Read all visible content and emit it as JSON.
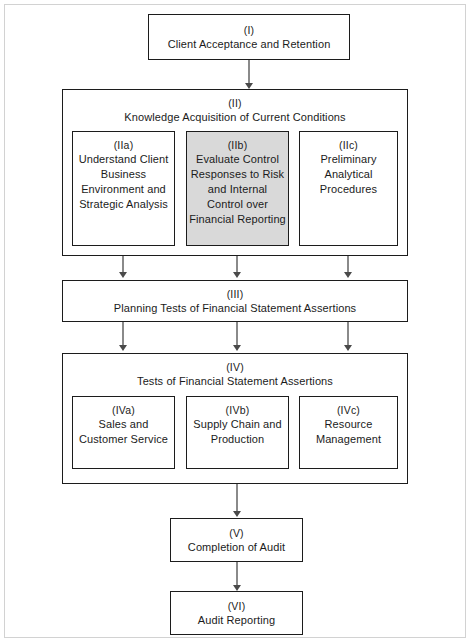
{
  "diagram": {
    "colors": {
      "box_border": "#1c1c1c",
      "shaded_fill": "#d9d9d9",
      "connector": "#8a8a8a",
      "arrowhead": "#4a4a4a",
      "page_frame": "#d2d2d2",
      "background": "#ffffff"
    },
    "nodes": {
      "i": {
        "roman": "(I)",
        "caption": "Client Acceptance and Retention"
      },
      "ii": {
        "roman": "(II)",
        "caption": "Knowledge Acquisition of Current Conditions",
        "children": [
          {
            "roman": "(IIa)",
            "caption": "Understand Client Business Environment and Strategic Analysis",
            "shaded": false
          },
          {
            "roman": "(IIb)",
            "caption": "Evaluate Control Responses to Risk and Internal Control over Financial Reporting",
            "shaded": true
          },
          {
            "roman": "(IIc)",
            "caption": "Preliminary Analytical Procedures",
            "shaded": false
          }
        ]
      },
      "iii": {
        "roman": "(III)",
        "caption": "Planning Tests of Financial Statement Assertions"
      },
      "iv": {
        "roman": "(IV)",
        "caption": "Tests of Financial Statement Assertions",
        "children": [
          {
            "roman": "(IVa)",
            "caption": "Sales and Customer Service",
            "shaded": false
          },
          {
            "roman": "(IVb)",
            "caption": "Supply Chain and Production",
            "shaded": false
          },
          {
            "roman": "(IVc)",
            "caption": "Resource Management",
            "shaded": false
          }
        ]
      },
      "v": {
        "roman": "(V)",
        "caption": "Completion of Audit"
      },
      "vi": {
        "roman": "(VI)",
        "caption": "Audit Reporting"
      }
    }
  }
}
